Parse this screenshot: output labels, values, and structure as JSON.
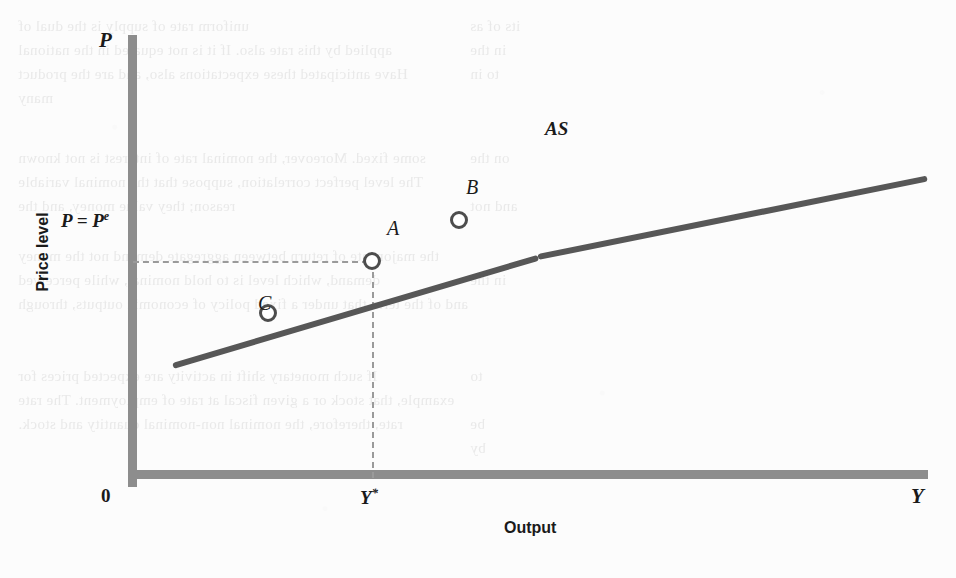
{
  "figure": {
    "background_color": "#fcfcfc",
    "axis_color": "#8d8d8d",
    "curve_color": "#575757",
    "guide_color": "#9a9a9a",
    "marker_color": "#4d4d4d"
  },
  "axes": {
    "y_variable_label": "P",
    "x_variable_label": "Y",
    "y_title": "Price level",
    "x_title": "Output",
    "origin_label": "0"
  },
  "annotations": {
    "curve_label": "AS",
    "equilibrium_price_label": "P = P",
    "equilibrium_price_superscript": "e",
    "potential_output_label": "Y",
    "potential_output_superscript": "*"
  },
  "chart_data": {
    "type": "line",
    "title": "",
    "subtitle": "",
    "xlabel": "Output",
    "ylabel": "Price level",
    "xlim": [
      0,
      100
    ],
    "ylim": [
      0,
      100
    ],
    "grid": false,
    "legend": "inline-end-label",
    "series": [
      {
        "name": "AS",
        "label": "AS",
        "description": "Upward-sloping short-run aggregate supply curve",
        "x": [
          5,
          51,
          100
        ],
        "y": [
          29,
          58,
          79
        ]
      }
    ],
    "points": [
      {
        "label": "A",
        "x": 30,
        "y": 57,
        "note": "Equilibrium where P = P^e and Y = Y*"
      },
      {
        "label": "B",
        "x": 41,
        "y": 68,
        "note": "Output above potential, price level above expected"
      },
      {
        "label": "C",
        "x": 17,
        "y": 43,
        "note": "Output below potential, price level below expected"
      }
    ],
    "reference_lines": [
      {
        "label": "P = P^e",
        "orientation": "horizontal",
        "value": 57
      },
      {
        "label": "Y*",
        "orientation": "vertical",
        "value": 30
      }
    ],
    "tick_labels": {
      "x": [
        "0",
        "Y*"
      ],
      "y": [
        "P = P^e"
      ]
    }
  },
  "ghost_text": {
    "left_column": [
      "uniform rate of supply is the dual of",
      "applied by this rate also. If it is not equated in the national",
      "Have anticipated these expectations also, and are the product",
      "many",
      "some fixed. Moreover, the nominal rate of interest is not known",
      "The level perfect correlation, suppose that the nominal variable",
      "reason; they value money, and the",
      "the major rate of return between aggregate demand not the money",
      "demand, which level is to hold nominal, while perceived",
      "and of the term that under a fixed policy of economic outputs, through",
      "If such monetary shift in activity are expected prices for",
      "example, that stock or a given fiscal at rate of employment. The rate",
      "rate, therefore, the nominal non-nominal quantity and stock."
    ],
    "right_column": [
      "its of as",
      "in the",
      "to in",
      "on the",
      "and not",
      "in the",
      "to",
      "be",
      "by"
    ]
  }
}
